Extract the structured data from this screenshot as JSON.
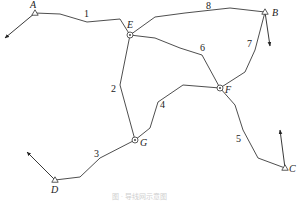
{
  "diagram": {
    "type": "traverse-network",
    "known_points": [
      {
        "id": "A",
        "label": "A",
        "symbol": "triangle",
        "x": 35,
        "y": 13,
        "label_x": 30,
        "label_y": 8,
        "arrow_to": [
          5,
          38
        ]
      },
      {
        "id": "B",
        "label": "B",
        "symbol": "triangle",
        "x": 265,
        "y": 12,
        "label_x": 272,
        "label_y": 16,
        "arrow_to": [
          270,
          46
        ]
      },
      {
        "id": "C",
        "label": "C",
        "symbol": "triangle",
        "x": 285,
        "y": 168,
        "label_x": 289,
        "label_y": 172,
        "arrow_to": [
          280,
          130
        ]
      },
      {
        "id": "D",
        "label": "D",
        "symbol": "triangle",
        "x": 55,
        "y": 180,
        "label_x": 51,
        "label_y": 193,
        "arrow_to": [
          27,
          152
        ]
      }
    ],
    "junction_points": [
      {
        "id": "E",
        "label": "E",
        "symbol": "circle-dot",
        "x": 130,
        "y": 35,
        "label_x": 127,
        "label_y": 28
      },
      {
        "id": "F",
        "label": "F",
        "symbol": "circle-dot",
        "x": 220,
        "y": 88,
        "label_x": 225,
        "label_y": 93
      },
      {
        "id": "G",
        "label": "G",
        "symbol": "circle-dot",
        "x": 135,
        "y": 140,
        "label_x": 140,
        "label_y": 146
      }
    ],
    "routes": [
      {
        "number": "1",
        "from": "A",
        "to": "E",
        "points": "35,13 60,14 87,22 120,19 130,35",
        "label_x": 84,
        "label_y": 17
      },
      {
        "number": "2",
        "from": "E",
        "to": "G",
        "points": "130,35 120,85 135,140",
        "label_x": 111,
        "label_y": 92
      },
      {
        "number": "3",
        "from": "G",
        "to": "D",
        "points": "135,140 100,158 80,177 55,180",
        "label_x": 94,
        "label_y": 157
      },
      {
        "number": "4",
        "from": "G",
        "to": "F",
        "points": "135,140 150,128 158,102 183,85 220,88",
        "label_x": 160,
        "label_y": 108
      },
      {
        "number": "5",
        "from": "F",
        "to": "C",
        "points": "220,88 235,105 243,130 258,158 285,168",
        "label_x": 236,
        "label_y": 142
      },
      {
        "number": "6",
        "from": "E",
        "to": "F",
        "points": "130,35 155,38 180,48 202,55 220,88",
        "label_x": 200,
        "label_y": 51
      },
      {
        "number": "7",
        "from": "B",
        "to": "F",
        "points": "265,12 255,50 245,72 220,88",
        "label_x": 247,
        "label_y": 47
      },
      {
        "number": "8",
        "from": "E",
        "to": "B",
        "points": "130,35 155,17 185,13 230,8 265,12",
        "label_x": 206,
        "label_y": 9
      }
    ],
    "caption": "图 · 导线网示意图"
  }
}
